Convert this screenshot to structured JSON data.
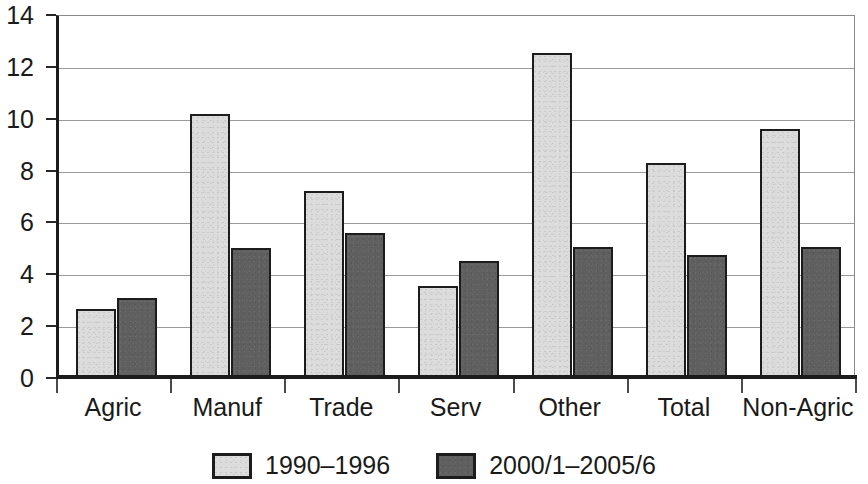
{
  "chart_data": {
    "type": "bar",
    "title": "",
    "subtitle": "",
    "xlabel": "",
    "ylabel": "",
    "ylim": [
      0,
      14
    ],
    "y_ticks": [
      0,
      2,
      4,
      6,
      8,
      10,
      12,
      14
    ],
    "y_tick_labels": [
      "0",
      "2",
      "4",
      "6",
      "8",
      "10",
      "12",
      "14"
    ],
    "grid": true,
    "grid_axis": "y",
    "legend_position": "bottom-center",
    "categories": [
      "Agric",
      "Manuf",
      "Trade",
      "Serv",
      "Other",
      "Total",
      "Non-Agric"
    ],
    "series": [
      {
        "name": "1990–1996",
        "color": "#dcdcdc",
        "values": [
          2.65,
          10.2,
          7.2,
          3.55,
          12.55,
          8.3,
          9.6
        ]
      },
      {
        "name": "2000/1–2005/6",
        "color": "#5f5f5f",
        "values": [
          3.1,
          5.0,
          5.6,
          4.5,
          5.05,
          4.75,
          5.05
        ]
      }
    ]
  },
  "axis": {
    "y_labels": [
      "14",
      "12",
      "10",
      "8",
      "6",
      "4",
      "2",
      "0"
    ],
    "x_labels": [
      "Agric",
      "Manuf",
      "Trade",
      "Serv",
      "Other",
      "Total",
      "Non-Agric"
    ]
  },
  "legend": {
    "entries": [
      {
        "label": "1990–1996",
        "swatch": "light-gray-swatch"
      },
      {
        "label": "2000/1–2005/6",
        "swatch": "dark-gray-swatch"
      }
    ]
  },
  "colors": {
    "series_1990_1996": "#dcdcdc",
    "series_2000_2005": "#5f5f5f",
    "axis": "#1c1c1c",
    "gridline": "#9a9a9a",
    "text": "#1a1a1a",
    "background": "#ffffff"
  }
}
